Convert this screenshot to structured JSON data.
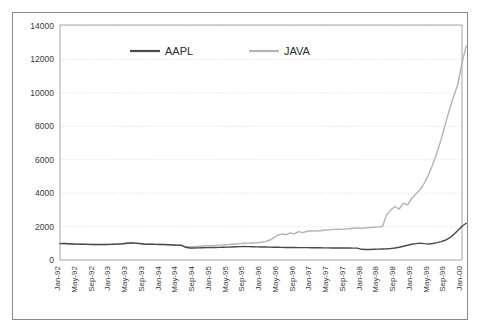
{
  "chart_data": {
    "type": "line",
    "title": "",
    "subtitle": "",
    "xlabel": "",
    "ylabel": "",
    "ylim": [
      0,
      14000
    ],
    "ytick_labels": [
      "0",
      "2000",
      "4000",
      "6000",
      "8000",
      "10000",
      "12000",
      "14000"
    ],
    "ytick_values": [
      0,
      2000,
      4000,
      6000,
      8000,
      10000,
      12000,
      14000
    ],
    "grid": true,
    "legend_position": "top-center",
    "xtick_labels": [
      "Jan-92",
      "May-92",
      "Sep-92",
      "Jan-93",
      "May-93",
      "Sep-93",
      "Jan-94",
      "May-94",
      "Sep-94",
      "Jan-95",
      "May-95",
      "Sep-95",
      "Jan-96",
      "May-96",
      "Sep-96",
      "Jan-97",
      "May-97",
      "Sep-97",
      "Jan-98",
      "May-98",
      "Sep-98",
      "Jan-99",
      "May-99",
      "Sep-99",
      "Jan-00"
    ],
    "xtick_step_months": 4,
    "x_start": "Jan-92",
    "x_end": "Jan-00",
    "n_points": 97,
    "series": [
      {
        "name": "AAPL",
        "color": "#4a4a4a",
        "values": [
          980,
          990,
          975,
          960,
          950,
          945,
          940,
          935,
          930,
          928,
          925,
          930,
          935,
          945,
          955,
          975,
          1005,
          1020,
          1010,
          985,
          960,
          945,
          940,
          935,
          930,
          925,
          915,
          900,
          890,
          880,
          760,
          720,
          715,
          725,
          735,
          740,
          745,
          750,
          755,
          760,
          770,
          780,
          790,
          800,
          805,
          800,
          790,
          785,
          780,
          775,
          770,
          765,
          760,
          755,
          750,
          748,
          745,
          742,
          740,
          738,
          735,
          733,
          730,
          728,
          725,
          722,
          720,
          718,
          716,
          714,
          712,
          710,
          640,
          628,
          630,
          640,
          650,
          660,
          672,
          690,
          720,
          760,
          820,
          880,
          940,
          980,
          1010,
          980,
          960,
          990,
          1040,
          1100,
          1180,
          1320,
          1520,
          1760,
          2020,
          2200
        ]
      },
      {
        "name": "JAVA",
        "color": "#b3b3b3",
        "values": [
          980,
          985,
          970,
          955,
          945,
          938,
          932,
          928,
          925,
          922,
          920,
          925,
          932,
          942,
          952,
          972,
          1000,
          1015,
          1005,
          980,
          958,
          942,
          938,
          932,
          928,
          922,
          912,
          898,
          885,
          872,
          800,
          790,
          800,
          818,
          838,
          850,
          862,
          875,
          888,
          900,
          918,
          938,
          958,
          980,
          1000,
          1010,
          1020,
          1035,
          1060,
          1100,
          1180,
          1320,
          1480,
          1560,
          1510,
          1620,
          1560,
          1700,
          1640,
          1720,
          1740,
          1730,
          1750,
          1780,
          1800,
          1820,
          1840,
          1830,
          1850,
          1870,
          1900,
          1920,
          1900,
          1920,
          1940,
          1960,
          1980,
          2000,
          2700,
          3000,
          3200,
          3050,
          3400,
          3300,
          3700,
          3950,
          4200,
          4600,
          5100,
          5700,
          6400,
          7200,
          8100,
          9000,
          9800,
          10500,
          11800,
          12800
        ]
      }
    ]
  },
  "legend": {
    "items": [
      {
        "label": "AAPL",
        "color": "#4a4a4a"
      },
      {
        "label": "JAVA",
        "color": "#b3b3b3"
      }
    ]
  }
}
